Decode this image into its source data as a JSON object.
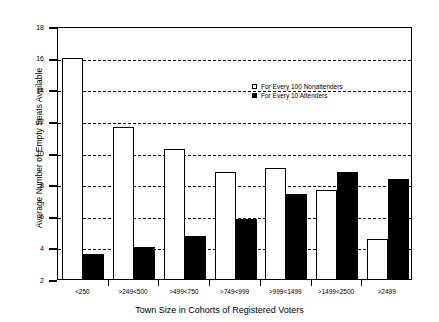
{
  "chart_data": {
    "type": "bar",
    "title": "",
    "xlabel": "Town Size in Cohorts of Registered Voters",
    "ylabel": "Average Number of Empty Seats Available",
    "categories": [
      "<250",
      ">249<500",
      ">499<750",
      ">749<999",
      ">999<1499",
      ">1499<2500",
      ">2499"
    ],
    "series": [
      {
        "name": "For Every 100 Nonattenders",
        "style": "open",
        "color": "#ffffff",
        "values": [
          16.0,
          11.6,
          10.2,
          8.75,
          9.0,
          7.6,
          4.5
        ]
      },
      {
        "name": "For Every 10 Attenders",
        "style": "filled",
        "color": "#000000",
        "values": [
          3.6,
          4.0,
          4.75,
          5.8,
          7.35,
          8.75,
          8.35
        ]
      }
    ],
    "ylim": [
      2,
      18
    ],
    "yticks": [
      2,
      4,
      6,
      8,
      10,
      12,
      14,
      16,
      18
    ],
    "ytick_labels": [
      "2",
      "4",
      "6",
      "8",
      "10",
      "12",
      "14",
      "16",
      "18"
    ],
    "grid": "horizontal-dashed",
    "legend_position": "upper-right-inside"
  },
  "legend": {
    "items": [
      {
        "label": "For Every 100 Nonattenders",
        "swatch": "open-square-icon"
      },
      {
        "label": "For Every 10 Attenders",
        "swatch": "filled-square-icon"
      }
    ]
  }
}
